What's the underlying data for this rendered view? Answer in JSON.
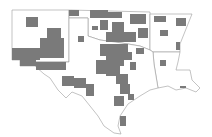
{
  "map": {
    "type": "choropleth",
    "region": "South Central United States",
    "states": [
      "New Mexico",
      "Oklahoma",
      "Texas",
      "Arkansas",
      "Louisiana"
    ],
    "colors": {
      "highlighted": "#7a7a7a",
      "background": "#ffffff",
      "border": "#9a9a9a"
    },
    "legend": null
  }
}
